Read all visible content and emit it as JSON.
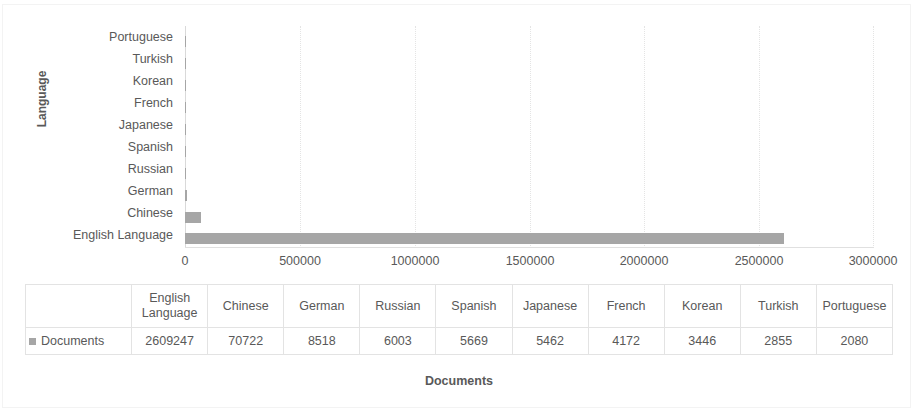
{
  "chart_data": {
    "type": "bar",
    "orientation": "horizontal",
    "title": "",
    "xlabel": "Documents",
    "ylabel": "Language",
    "categories": [
      "English Language",
      "Chinese",
      "German",
      "Russian",
      "Spanish",
      "Japanese",
      "French",
      "Korean",
      "Turkish",
      "Portuguese"
    ],
    "series": [
      {
        "name": "Documents",
        "values": [
          2609247,
          70722,
          8518,
          6003,
          5669,
          5462,
          4172,
          3446,
          2855,
          2080
        ],
        "color": "#a6a6a6"
      }
    ],
    "axis_category_order_top_to_bottom": [
      "Portuguese",
      "Turkish",
      "Korean",
      "French",
      "Japanese",
      "Spanish",
      "Russian",
      "German",
      "Chinese",
      "English Language"
    ],
    "xlim": [
      0,
      3000000
    ],
    "xticks": [
      0,
      500000,
      1000000,
      1500000,
      2000000,
      2500000,
      3000000
    ],
    "xtick_labels": [
      "0",
      "500000",
      "1000000",
      "1500000",
      "2000000",
      "2500000",
      "3000000"
    ],
    "grid": true,
    "grid_axis": "x",
    "legend_position": "table-left",
    "has_data_table": true
  },
  "axes": {
    "y_title": "Language",
    "x_title": "Documents"
  },
  "legend": {
    "series_label": "Documents",
    "swatch_color": "#a6a6a6",
    "swatch_icon": "square-swatch-icon"
  },
  "data_table": {
    "headers": [
      "English Language",
      "Chinese",
      "German",
      "Russian",
      "Spanish",
      "Japanese",
      "French",
      "Korean",
      "Turkish",
      "Portuguese"
    ],
    "row_label": "Documents",
    "values": [
      "2609247",
      "70722",
      "8518",
      "6003",
      "5669",
      "5462",
      "4172",
      "3446",
      "2855",
      "2080"
    ]
  },
  "colors": {
    "bar": "#a6a6a6",
    "text": "#595959",
    "gridline": "#e4e4e4",
    "table_border": "#e3e3e3"
  }
}
